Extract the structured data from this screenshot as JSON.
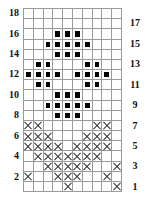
{
  "grid": {
    "columns": 10,
    "rows": 18,
    "filled": {
      "16": [
        3,
        4,
        5
      ],
      "15": [
        2,
        3,
        4,
        5,
        6
      ],
      "14": [
        3,
        4,
        5
      ],
      "13": [
        1,
        2,
        6,
        7
      ],
      "12": [
        0,
        1,
        2,
        3,
        5,
        6,
        7,
        8
      ],
      "11": [
        1,
        2,
        6,
        7
      ],
      "10": [
        3,
        4,
        5
      ],
      "9": [
        2,
        3,
        4,
        5,
        6
      ],
      "8": [
        3,
        4,
        5
      ]
    },
    "crossed": {
      "7": [
        0,
        1,
        7,
        8
      ],
      "6": [
        0,
        1,
        2,
        6,
        7,
        8
      ],
      "5": [
        0,
        1,
        2,
        3,
        5,
        6,
        7,
        8
      ],
      "4": [
        1,
        2,
        3,
        4,
        5,
        6,
        7
      ],
      "3": [
        2,
        3,
        4,
        5,
        6,
        9
      ],
      "2": [
        0,
        3,
        4,
        5,
        8
      ],
      "1": [
        4,
        9
      ]
    }
  },
  "labels": {
    "left": [
      "18",
      "16",
      "14",
      "12",
      "10",
      "8",
      "6",
      "4",
      "2"
    ],
    "right": [
      "17",
      "15",
      "13",
      "11",
      "9",
      "7",
      "5",
      "3",
      "1"
    ]
  }
}
